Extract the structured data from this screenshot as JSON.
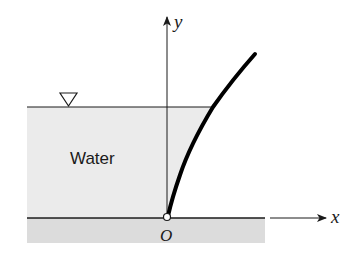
{
  "diagram": {
    "labels": {
      "water": "Water",
      "y_axis": "y",
      "x_axis": "x",
      "origin": "O"
    },
    "colors": {
      "water_fill": "#ebebeb",
      "ground_fill": "#dcdcdc",
      "line": "#1a1a1a",
      "background": "#ffffff"
    },
    "icons": {
      "free_surface": "inverted-triangle-icon"
    }
  }
}
